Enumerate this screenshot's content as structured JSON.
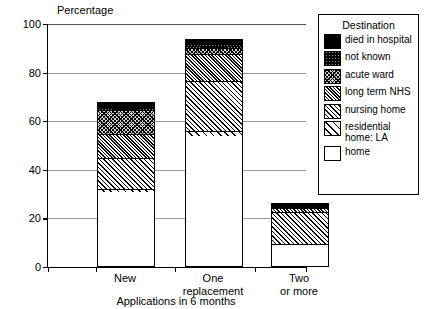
{
  "chart_data": {
    "type": "bar",
    "stacked": true,
    "title": "",
    "ylabel": "Percentage",
    "xlabel": "Applications in 6 months",
    "ylim": [
      0,
      100
    ],
    "yticks": [
      0,
      20,
      40,
      60,
      80,
      100
    ],
    "grid": true,
    "legend_position": "right",
    "legend_title": "Destination",
    "categories": [
      "New",
      "One replacement",
      "Two or more"
    ],
    "category_lines": [
      [
        "New"
      ],
      [
        "One",
        "replacement"
      ],
      [
        "Two",
        "or more"
      ]
    ],
    "series": [
      {
        "name": "home",
        "pattern": "solid-white",
        "values": [
          31.0,
          54.0,
          9.0
        ]
      },
      {
        "name": "residential home: LA",
        "pattern": "wide-diagonal",
        "values": [
          1.0,
          2.0,
          0.5
        ]
      },
      {
        "name": "nursing home",
        "pattern": "medium-diagonal",
        "values": [
          13.0,
          21.0,
          13.5
        ]
      },
      {
        "name": "long term NHS",
        "pattern": "dense-diagonal",
        "values": [
          10.0,
          11.0,
          1.5
        ]
      },
      {
        "name": "acute ward",
        "pattern": "light-crosshatch",
        "values": [
          10.0,
          2.5,
          0.5
        ]
      },
      {
        "name": "not known",
        "pattern": "dark-crosshatch",
        "values": [
          1.0,
          1.5,
          0.5
        ]
      },
      {
        "name": "died in hospital",
        "pattern": "solid-black",
        "values": [
          2.0,
          2.0,
          1.0
        ]
      }
    ],
    "cumulative_tops": {
      "New": [
        31.0,
        32.0,
        45.0,
        55.0,
        65.0,
        66.0,
        68.0
      ],
      "One replacement": [
        54.0,
        56.0,
        77.0,
        88.0,
        90.5,
        92.0,
        94.0
      ],
      "Two or more": [
        9.0,
        9.5,
        23.0,
        24.5,
        25.0,
        25.5,
        26.0
      ]
    }
  },
  "legend": {
    "title": "Destination",
    "entries": [
      {
        "label": "died in hospital"
      },
      {
        "label": "not known"
      },
      {
        "label": "acute ward"
      },
      {
        "label": "long term NHS"
      },
      {
        "label": "nursing home"
      },
      {
        "label": "residential",
        "label2": "home: LA"
      },
      {
        "label": "home"
      }
    ]
  },
  "axes": {
    "y_title": "Percentage",
    "x_title": "Applications in 6 months",
    "y_tick_labels": [
      "100",
      "80",
      "60",
      "40",
      "20",
      "0"
    ]
  }
}
